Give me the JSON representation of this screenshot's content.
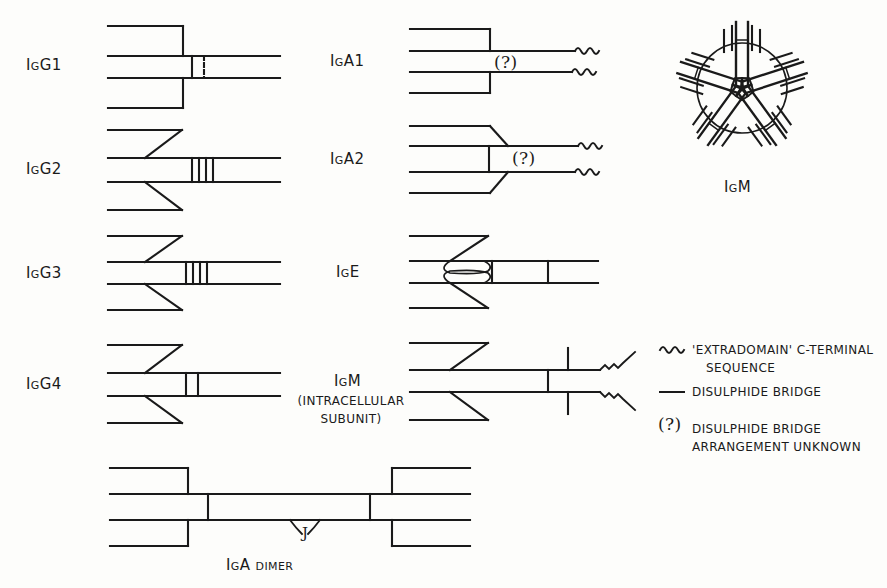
{
  "figure": {
    "background_color": "#fdfdfb",
    "ink_color": "#1a1a1a"
  },
  "molecules": [
    {
      "id": "igg1",
      "label": "IgG1",
      "hinge_bridges": 2,
      "hinge_style": "bracket",
      "notes": "Light chain joined to heavy chain by bracket; two hinge disulphide bridges"
    },
    {
      "id": "igg2",
      "label": "IgG2",
      "hinge_bridges": 4,
      "hinge_style": "diagonal",
      "notes": "Light chain joined by diagonal; four hinge disulphide bridges"
    },
    {
      "id": "igg3",
      "label": "IgG3",
      "hinge_bridges": 4,
      "hinge_style": "diagonal",
      "notes": "Extended hinge with multiple disulphide bridges"
    },
    {
      "id": "igg4",
      "label": "IgG4",
      "hinge_bridges": 2,
      "hinge_style": "diagonal",
      "notes": "Two hinge disulphide bridges"
    },
    {
      "id": "iga1",
      "label": "IgA1",
      "hinge_bridges": 0,
      "hinge_style": "bracket",
      "unknown_marker": "(?)",
      "extradomain": true,
      "notes": "Disulphide bridge arrangement unknown; extradomain C-terminal sequence"
    },
    {
      "id": "iga2",
      "label": "IgA2",
      "hinge_bridges": 0,
      "hinge_style": "diagonal-split",
      "unknown_marker": "(?)",
      "extradomain": true,
      "notes": "Light chains disulphide bonded to each other; extradomain C-terminal"
    },
    {
      "id": "ige",
      "label": "IgE",
      "hinge_bridges": 2,
      "hinge_style": "loop",
      "notes": "Extra domain shown as loops; two inter-heavy-chain bridges"
    },
    {
      "id": "igm-subunit",
      "label": "IgM",
      "sublabel_line1": "(INTRACELLULAR",
      "sublabel_line2": "SUBUNIT)",
      "hinge_bridges": 2,
      "hinge_style": "diagonal",
      "extradomain": true,
      "notes": "Intracellular subunit with extradomain C-terminal sequences"
    },
    {
      "id": "igm-pentamer",
      "label": "IgM",
      "subunits": 5,
      "shape": "pentamer-ring",
      "notes": "Five subunits radiating from a central ring"
    },
    {
      "id": "iga-dimer",
      "label": "IgA dimer",
      "j_chain_label": "J",
      "notes": "Two IgA monomers joined tail-to-tail via J chain"
    }
  ],
  "legend": {
    "items": [
      {
        "symbol": "squiggle",
        "line1": "'EXTRADOMAIN' C-TERMINAL",
        "line2": "SEQUENCE"
      },
      {
        "symbol": "short-line",
        "line1": "DISULPHIDE BRIDGE",
        "line2": ""
      },
      {
        "symbol": "(?)",
        "line1": "DISULPHIDE BRIDGE",
        "line2": "ARRANGEMENT UNKNOWN"
      }
    ]
  }
}
